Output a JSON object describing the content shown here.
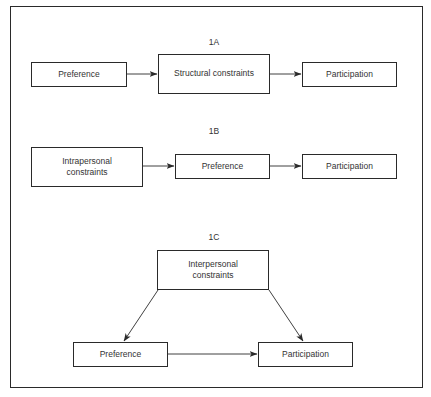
{
  "diagram": {
    "panels": [
      {
        "id": "1A",
        "label": "1A",
        "nodes": [
          {
            "id": "a-pref",
            "text": "Preference"
          },
          {
            "id": "a-struct",
            "text": "Structural constraints"
          },
          {
            "id": "a-part",
            "text": "Participation"
          }
        ],
        "edges": [
          {
            "from": "Preference",
            "to": "Structural constraints"
          },
          {
            "from": "Structural constraints",
            "to": "Participation"
          }
        ]
      },
      {
        "id": "1B",
        "label": "1B",
        "nodes": [
          {
            "id": "b-intra",
            "text": "Intrapersonal constraints"
          },
          {
            "id": "b-pref",
            "text": "Preference"
          },
          {
            "id": "b-part",
            "text": "Participation"
          }
        ],
        "edges": [
          {
            "from": "Intrapersonal constraints",
            "to": "Preference"
          },
          {
            "from": "Preference",
            "to": "Participation"
          }
        ]
      },
      {
        "id": "1C",
        "label": "1C",
        "nodes": [
          {
            "id": "c-inter",
            "text": "Interpersonal constraints"
          },
          {
            "id": "c-pref",
            "text": "Preference"
          },
          {
            "id": "c-part",
            "text": "Participation"
          }
        ],
        "edges": [
          {
            "from": "Interpersonal constraints",
            "to": "Preference"
          },
          {
            "from": "Interpersonal constraints",
            "to": "Participation"
          },
          {
            "from": "Preference",
            "to": "Participation"
          }
        ]
      }
    ],
    "colors": {
      "stroke": "#2a2a2a",
      "text": "#333333",
      "background": "#ffffff"
    }
  }
}
